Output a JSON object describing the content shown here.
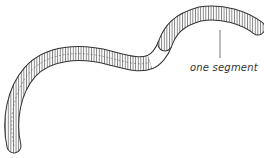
{
  "diagram": {
    "annotation": {
      "label": "one segment"
    },
    "caption": "",
    "colors": {
      "outline": "#333333",
      "fill": "#ffffff",
      "clitellum": "#ffffff"
    }
  }
}
